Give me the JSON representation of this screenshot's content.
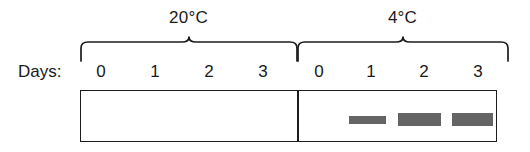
{
  "figure": {
    "type": "gel-blot",
    "days_label": "Days:",
    "groups": [
      {
        "id": "group-20c",
        "temperature_label": "20°C",
        "day_ticks": [
          "0",
          "1",
          "2",
          "3"
        ],
        "bands": []
      },
      {
        "id": "group-4c",
        "temperature_label": "4°C",
        "day_ticks": [
          "0",
          "1",
          "2",
          "3"
        ],
        "bands": [
          {
            "day": "1",
            "intensity": "medium"
          },
          {
            "day": "2",
            "intensity": "strong"
          },
          {
            "day": "3",
            "intensity": "strong"
          }
        ]
      }
    ],
    "colors": {
      "band": "#646464",
      "outline": "#1c1c1c",
      "text": "#1a1a1a",
      "background": "#ffffff"
    }
  }
}
